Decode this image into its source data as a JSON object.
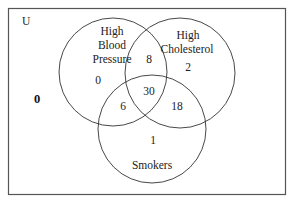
{
  "universe": {
    "label": "U",
    "outside_count": "0"
  },
  "sets": [
    {
      "name": "High Blood Pressure",
      "lines": [
        "High",
        "Blood",
        "Pressure"
      ],
      "only_count": "0"
    },
    {
      "name": "High Cholesterol",
      "lines": [
        "High",
        "Cholesterol"
      ],
      "only_count": "2"
    },
    {
      "name": "Smokers",
      "lines": [
        "Smokers"
      ],
      "only_count": "1"
    }
  ],
  "intersections": {
    "bp_chol": "8",
    "bp_smokers": "6",
    "chol_smokers": "18",
    "all_three": "30"
  },
  "colors": {
    "stroke": "#333333",
    "border": "#555555",
    "background": "#ffffff"
  }
}
